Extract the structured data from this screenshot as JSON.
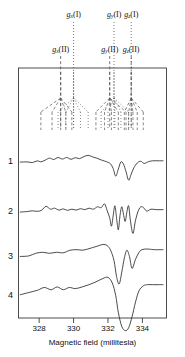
{
  "figure": {
    "type": "epr-spectra-with-stick-diagram",
    "xaxis": {
      "title": "Magnetic field (millitesla)",
      "ticks": [
        328,
        330,
        332,
        334
      ],
      "tick_labels": [
        "328",
        "330",
        "332",
        "334"
      ],
      "range": [
        326.8,
        335.4
      ],
      "unit": "millitesla"
    },
    "trace_labels": [
      "1",
      "2",
      "3",
      "4"
    ],
    "marker_labels_row1": [
      {
        "text": "g",
        "sub": "x",
        "paren": "(I)",
        "x_mT": 330.0
      },
      {
        "text": "g",
        "sub": "y",
        "paren": "(I)",
        "x_mT": 332.35
      },
      {
        "text": "g",
        "sub": "z",
        "paren": "(I)",
        "x_mT": 333.35
      }
    ],
    "marker_labels_row2": [
      {
        "text": "g",
        "sub": "x",
        "paren": "(II)",
        "x_mT": 329.25
      },
      {
        "text": "g",
        "sub": "y",
        "paren": "(II)",
        "x_mT": 332.1
      },
      {
        "text": "g",
        "sub": "z",
        "paren": "(II)",
        "x_mT": 333.35
      }
    ],
    "legend_note": {
      "site_I": "I",
      "site_II": "II"
    }
  },
  "chart_data": {
    "type": "line",
    "title": "",
    "xlabel": "Magnetic field (millitesla)",
    "ylabel": "",
    "xlim": [
      326.8,
      335.4
    ],
    "grid": false,
    "legend": "none",
    "tick_labels": [
      "328",
      "330",
      "332",
      "334"
    ],
    "annotations": [
      {
        "label": "g_x(I)",
        "x": 330.0,
        "style": "dotted"
      },
      {
        "label": "g_y(I)",
        "x": 332.35,
        "style": "dotted"
      },
      {
        "label": "g_z(I)",
        "x": 333.35,
        "style": "dotted"
      },
      {
        "label": "g_x(II)",
        "x": 329.25,
        "style": "dashed"
      },
      {
        "label": "g_y(II)",
        "x": 332.1,
        "style": "dashed"
      },
      {
        "label": "g_z(II)",
        "x": 333.35,
        "style": "dashed"
      }
    ],
    "series": [
      {
        "name": "1",
        "x": [
          326.9,
          327.3,
          327.6,
          327.9,
          328.1,
          328.35,
          328.6,
          328.85,
          329.1,
          329.35,
          329.6,
          329.85,
          330.1,
          330.35,
          330.6,
          330.85,
          331.1,
          331.35,
          331.6,
          331.8,
          332.0,
          332.15,
          332.3,
          332.45,
          332.6,
          332.75,
          332.9,
          333.05,
          333.2,
          333.35,
          333.5,
          333.7,
          333.9,
          334.1,
          334.35,
          334.6,
          334.9,
          335.2
        ],
        "y": [
          0.04,
          0.05,
          0.02,
          0.1,
          0.05,
          0.13,
          0.22,
          0.16,
          0.25,
          0.18,
          0.25,
          0.17,
          0.24,
          0.2,
          0.29,
          0.35,
          0.28,
          0.22,
          0.14,
          0.09,
          0.03,
          -0.04,
          -0.25,
          -0.6,
          -0.28,
          0.05,
          -0.05,
          -0.4,
          -0.78,
          -0.5,
          -0.22,
          0.0,
          0.08,
          -0.02,
          0.06,
          0.1,
          0.1,
          0.1
        ]
      },
      {
        "name": "2",
        "x": [
          326.9,
          327.3,
          327.6,
          327.9,
          328.15,
          328.4,
          328.65,
          328.9,
          329.15,
          329.4,
          329.65,
          329.9,
          330.15,
          330.4,
          330.65,
          330.9,
          331.15,
          331.4,
          331.6,
          331.8,
          331.95,
          332.1,
          332.2,
          332.3,
          332.4,
          332.5,
          332.6,
          332.7,
          332.8,
          332.9,
          333.0,
          333.1,
          333.2,
          333.3,
          333.45,
          333.6,
          333.8,
          334.0,
          334.25,
          334.5,
          334.8,
          335.2
        ],
        "y": [
          0.04,
          0.06,
          0.09,
          0.07,
          0.12,
          0.28,
          0.16,
          0.2,
          0.12,
          0.17,
          0.11,
          0.16,
          0.12,
          0.18,
          0.14,
          0.2,
          0.16,
          0.26,
          0.22,
          0.38,
          0.1,
          -0.2,
          -0.55,
          -0.12,
          0.3,
          -0.22,
          -0.7,
          -0.1,
          0.26,
          -0.05,
          -0.35,
          0.05,
          0.3,
          -0.3,
          -0.85,
          -0.3,
          0.16,
          0.26,
          0.08,
          0.16,
          0.14,
          0.14
        ]
      },
      {
        "name": "3",
        "x": [
          326.9,
          327.4,
          327.8,
          328.2,
          328.6,
          329.0,
          329.4,
          329.8,
          330.2,
          330.5,
          330.8,
          331.1,
          331.4,
          331.7,
          331.95,
          332.15,
          332.35,
          332.5,
          332.65,
          332.8,
          332.95,
          333.1,
          333.25,
          333.4,
          333.6,
          333.85,
          334.1,
          334.4,
          334.7,
          335.2
        ],
        "y": [
          0.06,
          0.08,
          0.18,
          0.22,
          0.18,
          0.22,
          0.2,
          0.3,
          0.32,
          0.3,
          0.34,
          0.4,
          0.46,
          0.52,
          0.48,
          0.3,
          -0.1,
          -0.72,
          -1.0,
          -0.55,
          0.0,
          0.3,
          0.05,
          -0.4,
          -0.05,
          0.26,
          0.34,
          0.34,
          0.32,
          0.32
        ]
      },
      {
        "name": "4",
        "x": [
          326.9,
          327.4,
          327.9,
          328.3,
          328.7,
          329.05,
          329.4,
          329.75,
          330.1,
          330.5,
          330.9,
          331.3,
          331.7,
          332.0,
          332.25,
          332.45,
          332.6,
          332.8,
          333.0,
          333.2,
          333.4,
          333.6,
          333.8,
          334.05,
          334.3,
          334.6,
          334.9,
          335.2
        ],
        "y": [
          0.08,
          0.16,
          0.24,
          0.34,
          0.26,
          0.36,
          0.26,
          0.34,
          0.3,
          0.36,
          0.44,
          0.54,
          0.66,
          0.7,
          0.5,
          0.05,
          -0.55,
          -1.05,
          -1.2,
          -1.1,
          -0.7,
          -0.18,
          0.22,
          0.4,
          0.44,
          0.44,
          0.44,
          0.44
        ]
      }
    ],
    "stick_diagrams": [
      {
        "site": "II",
        "style": "dashed",
        "root_x": 329.25,
        "leaves_x": [
          328.1,
          328.75,
          329.25,
          329.55,
          329.9
        ]
      },
      {
        "site": "I",
        "style": "dotted",
        "root_x": 330.0,
        "leaves_x": [
          329.1,
          329.55,
          330.0,
          330.4,
          330.85
        ]
      },
      {
        "site": "II",
        "style": "dashed",
        "root_x": 332.1,
        "leaves_x": [
          331.3,
          331.8,
          332.2,
          332.6,
          333.05
        ]
      },
      {
        "site": "I",
        "style": "dotted",
        "root_x": 332.35,
        "leaves_x": [
          331.6,
          332.0,
          332.4,
          332.75,
          333.2
        ]
      },
      {
        "site": "I+II",
        "style": "dashed",
        "root_x": 333.35,
        "leaves_x": [
          332.95,
          333.2,
          333.45,
          333.7,
          334.05
        ]
      }
    ]
  }
}
